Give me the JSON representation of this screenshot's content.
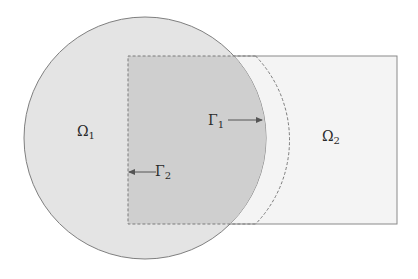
{
  "diagram": {
    "type": "domain-decomposition",
    "colors": {
      "background": "#ffffff",
      "circle_fill": "#e4e4e4",
      "overlap_fill": "#cfcfcf",
      "rect_fill": "#f4f4f4",
      "stroke": "#8a8a8a",
      "dashed_stroke": "#7a7a7a",
      "text": "#2a2a2a"
    },
    "shapes": {
      "circle": {
        "cx": 145,
        "cy": 138,
        "r": 121
      },
      "rectangle": {
        "x": 128,
        "y": 56,
        "width": 269,
        "height": 168
      }
    },
    "labels": {
      "omega1": {
        "base": "Ω",
        "sub": "1"
      },
      "omega2": {
        "base": "Ω",
        "sub": "2"
      },
      "gamma1": {
        "base": "Γ",
        "sub": "1"
      },
      "gamma2": {
        "base": "Γ",
        "sub": "2"
      }
    }
  }
}
